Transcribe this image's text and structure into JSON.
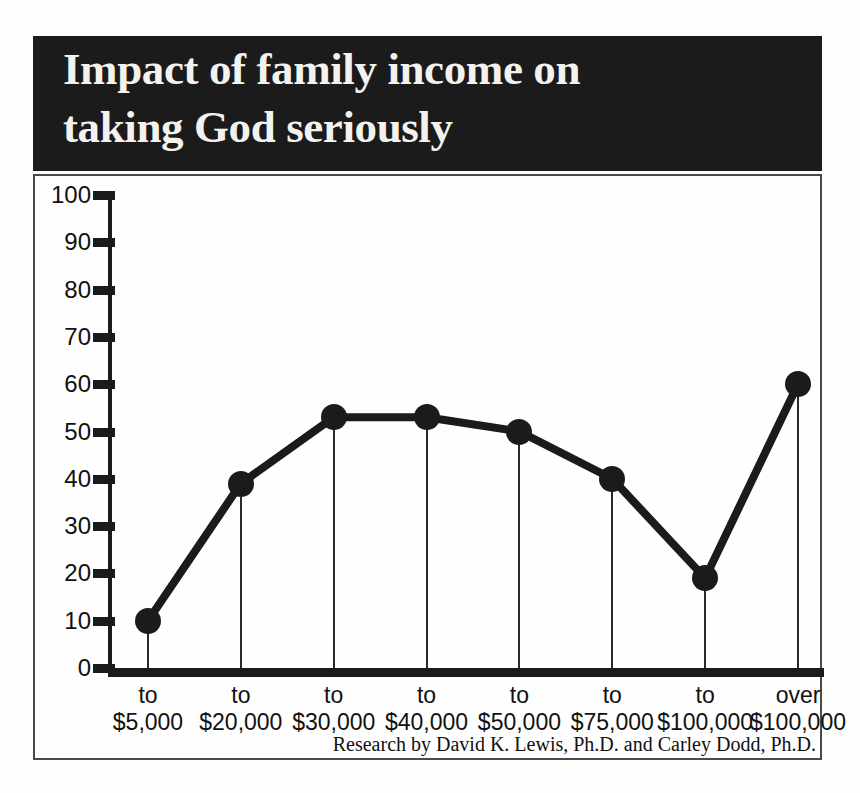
{
  "title": {
    "line1": "Impact of family income on",
    "line2": "taking God seriously",
    "full": "Impact of family income on taking God seriously"
  },
  "attribution": "Research by David K. Lewis, Ph.D. and Carley Dodd, Ph.D.",
  "colors": {
    "banner_background": "#1b1b1b",
    "banner_text": "#f4f2ee",
    "axis": "#1b1b1b",
    "series": "#1b1b1b",
    "frame_border": "#4a4a4a",
    "plot_background": "#fefefe"
  },
  "axis": {
    "y_ticks": [
      "0",
      "10",
      "20",
      "30",
      "40",
      "50",
      "60",
      "70",
      "80",
      "90",
      "100"
    ],
    "x_line1": [
      "to",
      "to",
      "to",
      "to",
      "to",
      "to",
      "to",
      "over"
    ],
    "x_line2": [
      "$5,000",
      "$20,000",
      "$30,000",
      "$40,000",
      "$50,000",
      "$75,000",
      "$100,000",
      "$100,000"
    ]
  },
  "chart_data": {
    "type": "line",
    "title": "Impact of family income on taking God seriously",
    "xlabel": "",
    "ylabel": "",
    "ylim": [
      0,
      100
    ],
    "ytick_step": 10,
    "grid": false,
    "legend": "none",
    "markers": "filled-circle",
    "droplines": true,
    "categories": [
      "to $5,000",
      "to $20,000",
      "to $30,000",
      "to $40,000",
      "to $50,000",
      "to $75,000",
      "to $100,000",
      "over $100,000"
    ],
    "values": [
      10,
      39,
      53,
      53,
      50,
      40,
      19,
      60
    ],
    "annotations": [
      "Research by David K. Lewis, Ph.D. and Carley Dodd, Ph.D."
    ]
  }
}
